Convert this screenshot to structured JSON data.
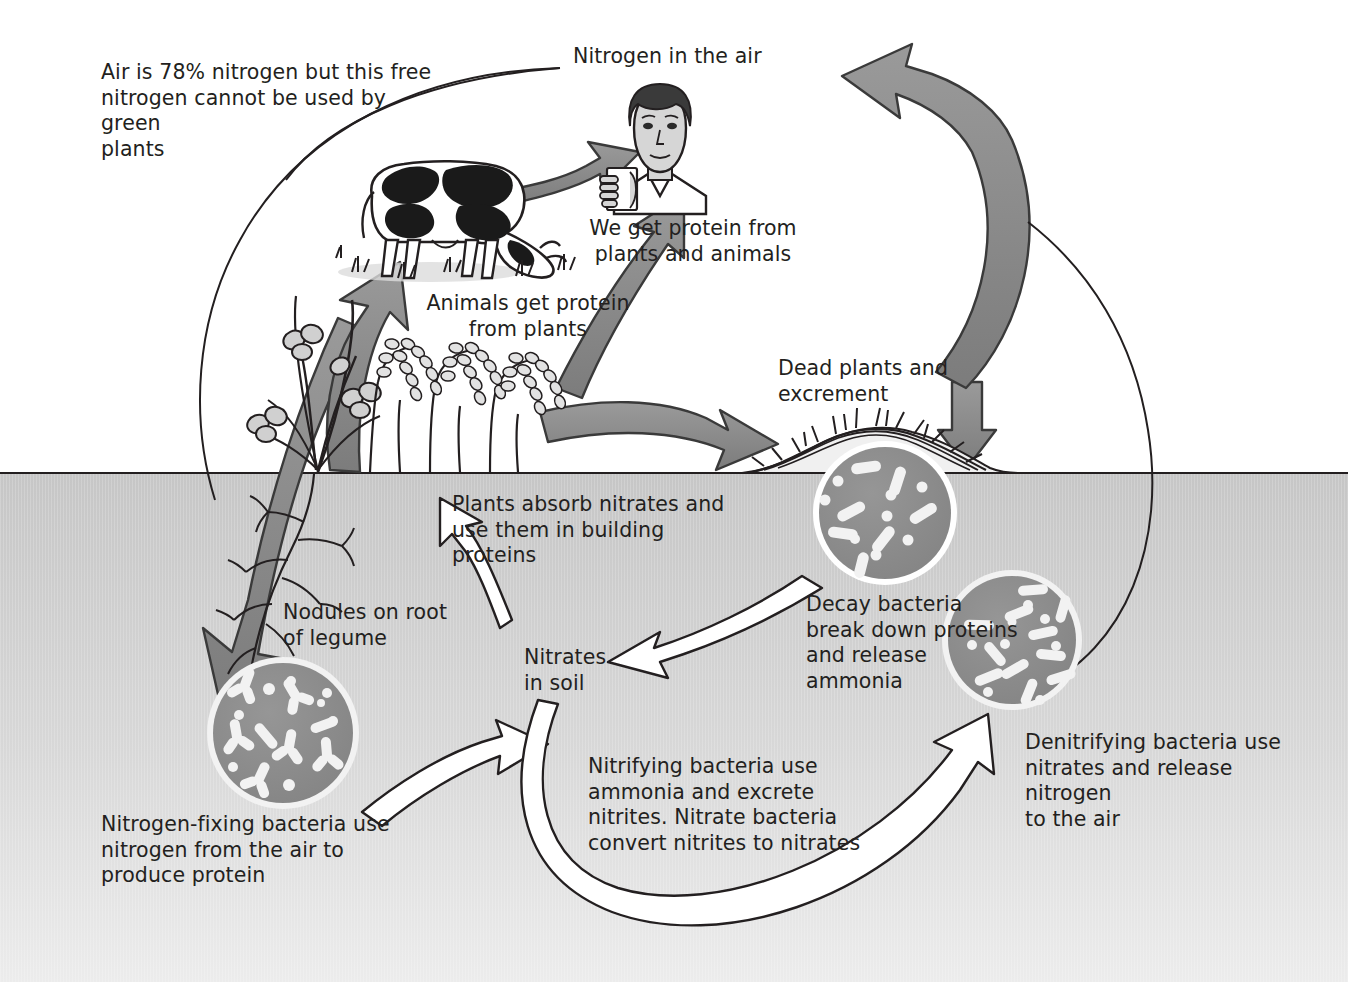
{
  "diagram": {
    "type": "cycle-diagram",
    "palette": {
      "background": "#ffffff",
      "soil_top": "#c8c8c8",
      "soil_bottom": "#e8e8e8",
      "thick_arrow_fill": "#8a8a8a",
      "thick_arrow_stroke": "#3a3a3a",
      "hollow_arrow_fill": "#ffffff",
      "hollow_arrow_stroke": "#231f20",
      "bacteria_circle_fill": "#8c8c8c",
      "bacteria_body": "#f2f2f2",
      "text": "#231f20",
      "line": "#231f20"
    },
    "soil_line_y": 473
  },
  "labels": {
    "air_note": "Air is 78% nitrogen but this free\nnitrogen cannot be used by green\nplants",
    "nitrogen_in_air": "Nitrogen in the air",
    "we_get_protein": "We get protein from\nplants and animals",
    "animals_get_protein": "Animals get protein\nfrom plants",
    "dead_plants": "Dead plants and\nexcrement",
    "plants_absorb": "Plants absorb nitrates and\nuse them in building\nproteins",
    "nodules": "Nodules on root\nof legume",
    "nitrates_in_soil": "Nitrates\nin soil",
    "decay_bacteria": "Decay bacteria\nbreak down proteins\nand release\nammonia",
    "denitrifying_bacteria": "Denitrifying bacteria use\nnitrates and release nitrogen\nto the air",
    "nitrifying_bacteria": "Nitrifying bacteria use\nammonia and excrete\nnitrites. Nitrate bacteria\nconvert nitrites to nitrates",
    "nitrogen_fixing": "Nitrogen-fixing bacteria use\nnitrogen from the air to\nproduce protein"
  },
  "figures": [
    {
      "name": "cow",
      "caption": "Animals get protein from plants"
    },
    {
      "name": "person-drinking",
      "caption": "We get protein from plants and animals"
    },
    {
      "name": "legume-and-grain-plants",
      "caption": "Plants absorb nitrates"
    },
    {
      "name": "dead-plant-litter-pile",
      "caption": "Dead plants and excrement"
    },
    {
      "name": "nitrogen-fixing-bacteria-circle",
      "caption": "Nitrogen-fixing bacteria"
    },
    {
      "name": "decay-bacteria-circle",
      "caption": "Decay bacteria"
    },
    {
      "name": "denitrifying-bacteria-circle",
      "caption": "Denitrifying bacteria"
    }
  ],
  "arrows": [
    {
      "name": "cow-to-person",
      "style": "thick-grey",
      "from": "cow",
      "to": "person"
    },
    {
      "name": "plants-to-person",
      "style": "thick-grey",
      "from": "plants",
      "to": "person"
    },
    {
      "name": "plants-to-cow",
      "style": "thick-grey",
      "from": "plants",
      "to": "cow"
    },
    {
      "name": "plants-to-dead-matter",
      "style": "thick-grey",
      "from": "plants",
      "to": "litter-pile"
    },
    {
      "name": "air-to-nitrogen-fixing",
      "style": "thick-grey",
      "from": "air",
      "to": "nitrogen-fixing-bacteria"
    },
    {
      "name": "denitrifying-to-air",
      "style": "thick-grey",
      "from": "soil",
      "to": "nitrogen-in-air"
    },
    {
      "name": "decay-to-nitrates",
      "style": "hollow-outline",
      "from": "decay-bacteria",
      "to": "nitrates-in-soil"
    },
    {
      "name": "nitrates-to-plants",
      "style": "hollow-outline",
      "from": "nitrates-in-soil",
      "to": "plant-roots"
    },
    {
      "name": "nitrifying-to-nitrates",
      "style": "hollow-outline",
      "from": "nitrifying-bacteria",
      "to": "nitrates-in-soil"
    },
    {
      "name": "nitrates-to-denitrifying",
      "style": "hollow-outline",
      "from": "nitrates-in-soil",
      "to": "denitrifying-bacteria"
    },
    {
      "name": "air-note-leader-line",
      "style": "thin-line",
      "from": "air-note",
      "to": "atmosphere-arc"
    }
  ]
}
